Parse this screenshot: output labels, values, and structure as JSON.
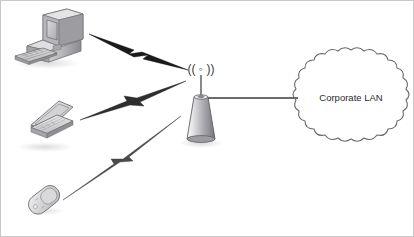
{
  "diagram": {
    "background_color": "#ffffff",
    "border_color": "#c8c8c8",
    "line_color": "#3a3a3a"
  },
  "nodes": {
    "desktop": {
      "name": "desktop-computer",
      "label": "",
      "x": 12,
      "y": 8
    },
    "laptop": {
      "name": "laptop-computer",
      "label": "",
      "x": 12,
      "y": 96
    },
    "phone": {
      "name": "mobile-phone",
      "label": "",
      "x": 22,
      "y": 180
    },
    "access_point": {
      "name": "wireless-access-point",
      "radio_symbol": "(( ◦ ))",
      "label": "",
      "x": 186,
      "y": 62
    },
    "cloud": {
      "name": "corporate-lan-cloud",
      "label": "Corporate LAN",
      "cx": 350,
      "cy": 97,
      "rx": 60,
      "ry": 48
    }
  },
  "links": [
    {
      "name": "wireless-link-desktop",
      "type": "lightning-bolt",
      "from": "desktop",
      "to": "access-point"
    },
    {
      "name": "wireless-link-laptop",
      "type": "lightning-bolt",
      "from": "laptop",
      "to": "access-point"
    },
    {
      "name": "wireless-link-phone",
      "type": "lightning-bolt",
      "from": "phone",
      "to": "access-point"
    },
    {
      "name": "wired-link-lan",
      "type": "solid-line",
      "from": "access-point",
      "to": "cloud"
    }
  ],
  "colors": {
    "device_light": "#ececed",
    "device_mid": "#c2c2c4",
    "device_dark": "#8d8d90",
    "device_outline": "#6f6f72",
    "bolt_fill": "#1a1a1a",
    "cone_light": "#f2f2f3",
    "cone_dark": "#7e7e82",
    "shadow": "#d9d9db",
    "cloud_stroke": "#6a6a6e",
    "text": "#2b2b2b"
  }
}
